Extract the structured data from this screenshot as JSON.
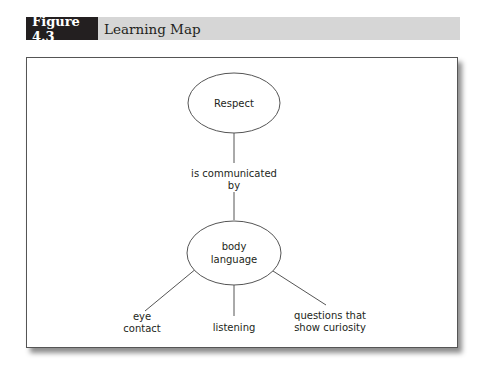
{
  "figure": {
    "number_label": "Figure 4.3",
    "title": "Learning Map"
  },
  "colors": {
    "label_bg": "#231f20",
    "header_bg": "#d6d6d6",
    "line": "#555555"
  },
  "nodes": {
    "respect": {
      "lines": [
        "Respect"
      ]
    },
    "link": {
      "lines": [
        "is communicated",
        "by"
      ]
    },
    "body_language": {
      "lines": [
        "body",
        "language"
      ]
    },
    "eye_contact": {
      "lines": [
        "eye",
        "contact"
      ]
    },
    "listening": {
      "lines": [
        "listening"
      ]
    },
    "questions": {
      "lines": [
        "questions that",
        "show curiosity"
      ]
    }
  }
}
